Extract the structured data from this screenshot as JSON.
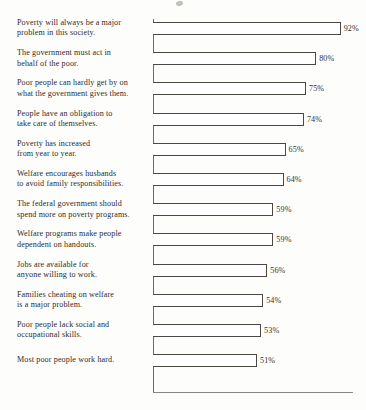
{
  "chart_data": {
    "type": "bar",
    "orientation": "horizontal",
    "title": "",
    "subtitle": "",
    "xlabel": "",
    "ylabel": "",
    "xlim": [
      0,
      100
    ],
    "grid": false,
    "legend": false,
    "value_suffix": "%",
    "categories": [
      "Poverty will always be a major problem in this society.",
      "The government must act in behalf of the poor.",
      "Poor people can hardly get by on what the government gives them.",
      "People have an obligation to take care of themselves.",
      "Poverty has increased from year to year.",
      "Welfare encourages husbands to avoid family responsibilities.",
      "The federal government should spend more on poverty programs.",
      "Welfare programs make people dependent on handouts.",
      "Jobs are available for anyone willing to work.",
      "Families cheating on welfare is a major problem.",
      "Poor people lack social and occupational skills.",
      "Most poor people work hard."
    ],
    "values": [
      92,
      80,
      75,
      74,
      65,
      64,
      59,
      59,
      56,
      54,
      53,
      51
    ],
    "value_labels": [
      "92%",
      "80%",
      "75%",
      "74%",
      "65%",
      "64%",
      "59%",
      "59%",
      "56%",
      "54%",
      "53%",
      "51%"
    ]
  },
  "rows": [
    {
      "lines": [
        "Poverty will always be a major",
        "problem in this society."
      ],
      "value": 92,
      "value_label": "92%"
    },
    {
      "lines": [
        "The government must act in",
        "behalf of the poor."
      ],
      "value": 80,
      "value_label": "80%"
    },
    {
      "lines": [
        "Poor people can hardly get by on",
        "what the government gives them."
      ],
      "value": 75,
      "value_label": "75%"
    },
    {
      "lines": [
        "People have an obligation to",
        "take care of themselves."
      ],
      "value": 74,
      "value_label": "74%"
    },
    {
      "lines": [
        "Poverty has increased",
        "from year to year."
      ],
      "value": 65,
      "value_label": "65%"
    },
    {
      "lines": [
        "Welfare encourages husbands",
        "to avoid family responsibilities."
      ],
      "value": 64,
      "value_label": "64%"
    },
    {
      "lines": [
        "The federal government should",
        "spend more on poverty programs."
      ],
      "value": 59,
      "value_label": "59%"
    },
    {
      "lines": [
        "Welfare programs make people",
        "dependent on handouts."
      ],
      "value": 59,
      "value_label": "59%"
    },
    {
      "lines": [
        "Jobs are available for",
        "anyone willing to work."
      ],
      "value": 56,
      "value_label": "56%"
    },
    {
      "lines": [
        "Families cheating on welfare",
        "is a major problem."
      ],
      "value": 54,
      "value_label": "54%"
    },
    {
      "lines": [
        "Poor people lack social and",
        "occupational skills."
      ],
      "value": 53,
      "value_label": "53%"
    },
    {
      "lines": [
        "Most poor people work hard."
      ],
      "value": 51,
      "value_label": "51%"
    }
  ],
  "colors": {
    "page_background": "#fdfdfc",
    "bar_fill": "#ffffff",
    "bar_outline": "#4a4744",
    "axis": "#6d6a66",
    "text": "#2e2b28"
  },
  "geometry": {
    "axis_x": 153,
    "px_per_percent": 2.04,
    "bar_height": 13,
    "first_bar_top": 22,
    "row_pitch": 30.2
  }
}
